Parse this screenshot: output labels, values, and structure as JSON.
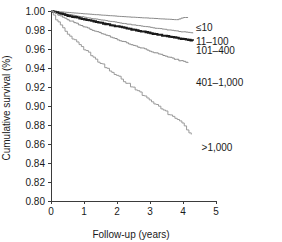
{
  "chart_data": {
    "type": "line",
    "title": "",
    "xlabel": "Follow-up (years)",
    "ylabel": "Cumulative survival (%)",
    "xlim": [
      0,
      5
    ],
    "ylim": [
      0.8,
      1.0
    ],
    "xticks": [
      "0",
      "1",
      "2",
      "3",
      "4",
      "5"
    ],
    "xtick_values": [
      0,
      1,
      2,
      3,
      4,
      5
    ],
    "yticks": [
      "0.80",
      "0.82",
      "0.84",
      "0.86",
      "0.88",
      "0.90",
      "0.92",
      "0.94",
      "0.96",
      "0.98",
      "1.00"
    ],
    "ytick_values": [
      0.8,
      0.82,
      0.84,
      0.86,
      0.88,
      0.9,
      0.92,
      0.94,
      0.96,
      0.98,
      1.0
    ],
    "grid": false,
    "legend_position": "right-inline-labels",
    "series": [
      {
        "name": "≤10",
        "label": "≤10",
        "color": "#8a8a8a",
        "width": 1.0,
        "label_x": 4.15,
        "label_y": 0.9825,
        "x": [
          0.0,
          0.2,
          0.4,
          0.6,
          0.8,
          1.0,
          1.2,
          1.4,
          1.6,
          1.8,
          2.0,
          2.2,
          2.4,
          2.6,
          2.8,
          3.0,
          3.2,
          3.4,
          3.6,
          3.8,
          4.0,
          4.15
        ],
        "y": [
          1.0,
          0.9993,
          0.9988,
          0.9982,
          0.9976,
          0.997,
          0.9965,
          0.996,
          0.9955,
          0.995,
          0.9945,
          0.994,
          0.9936,
          0.9932,
          0.9928,
          0.9924,
          0.992,
          0.9916,
          0.9912,
          0.9908,
          0.9932,
          0.993
        ]
      },
      {
        "name": "11–100",
        "label": "11–100",
        "color": "#8a8a8a",
        "width": 1.0,
        "label_x": 4.15,
        "label_y": 0.968,
        "x": [
          0.0,
          0.2,
          0.4,
          0.6,
          0.8,
          1.0,
          1.2,
          1.4,
          1.6,
          1.8,
          2.0,
          2.2,
          2.4,
          2.6,
          2.8,
          3.0,
          3.2,
          3.4,
          3.6,
          3.8,
          4.0,
          4.2,
          4.3
        ],
        "y": [
          1.0,
          0.9983,
          0.997,
          0.9958,
          0.9946,
          0.9934,
          0.9923,
          0.9912,
          0.9901,
          0.989,
          0.9879,
          0.9868,
          0.9858,
          0.9848,
          0.9838,
          0.9828,
          0.9818,
          0.9808,
          0.9798,
          0.9789,
          0.978,
          0.9771,
          0.9766
        ]
      },
      {
        "name": "101–400",
        "label": "101–400",
        "color": "#1a1a1a",
        "width": 2.1,
        "label_x": 4.15,
        "label_y": 0.9585,
        "x": [
          0.0,
          0.2,
          0.4,
          0.6,
          0.8,
          1.0,
          1.2,
          1.4,
          1.6,
          1.8,
          2.0,
          2.2,
          2.4,
          2.6,
          2.8,
          3.0,
          3.2,
          3.4,
          3.6,
          3.8,
          4.0,
          4.2,
          4.3
        ],
        "y": [
          1.0,
          0.9978,
          0.996,
          0.9944,
          0.9928,
          0.9912,
          0.9897,
          0.9882,
          0.9867,
          0.9852,
          0.9838,
          0.9823,
          0.9809,
          0.9795,
          0.9781,
          0.9767,
          0.9754,
          0.9741,
          0.9728,
          0.9716,
          0.9704,
          0.9692,
          0.9686
        ]
      },
      {
        "name": "401–1,000",
        "label": "401–1,000",
        "color": "#8a8a8a",
        "width": 1.0,
        "label_x": 4.15,
        "label_y": 0.925,
        "x": [
          0.0,
          0.2,
          0.4,
          0.6,
          0.8,
          1.0,
          1.2,
          1.4,
          1.6,
          1.8,
          2.0,
          2.2,
          2.4,
          2.6,
          2.8,
          3.0,
          3.2,
          3.4,
          3.6,
          3.8,
          4.0,
          4.15
        ],
        "y": [
          1.0,
          0.9958,
          0.9923,
          0.9892,
          0.9862,
          0.9833,
          0.9805,
          0.9778,
          0.9752,
          0.9726,
          0.97,
          0.9675,
          0.965,
          0.9626,
          0.9602,
          0.9578,
          0.9555,
          0.9532,
          0.951,
          0.9488,
          0.9468,
          0.9452
        ]
      },
      {
        "name": ">1,000",
        "label": ">1,000",
        "color": "#9a9a9a",
        "width": 1.0,
        "label_x": 4.32,
        "label_y": 0.8565,
        "x": [
          0.0,
          0.15,
          0.3,
          0.45,
          0.6,
          0.8,
          1.0,
          1.2,
          1.4,
          1.6,
          1.8,
          2.0,
          2.2,
          2.4,
          2.6,
          2.8,
          3.0,
          3.2,
          3.4,
          3.6,
          3.8,
          4.0,
          4.15,
          4.25
        ],
        "y": [
          1.0,
          0.991,
          0.984,
          0.978,
          0.973,
          0.966,
          0.9595,
          0.9535,
          0.9478,
          0.9423,
          0.937,
          0.9318,
          0.9266,
          0.9214,
          0.9162,
          0.911,
          0.9058,
          0.9006,
          0.8954,
          0.8906,
          0.8858,
          0.88,
          0.874,
          0.87
        ]
      }
    ]
  },
  "axes": {
    "x_title": "Follow-up (years)",
    "y_title": "Cumulative survival (%)"
  }
}
